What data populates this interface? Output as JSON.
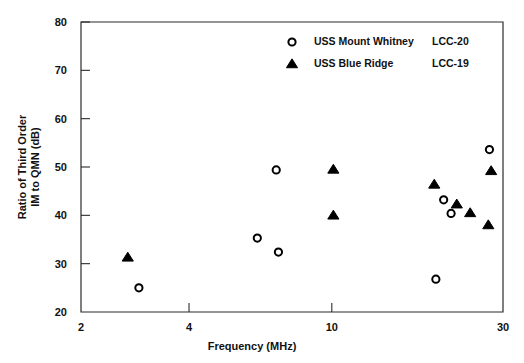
{
  "chart_data": {
    "type": "scatter",
    "title": "",
    "xlabel": "Frequency (MHz)",
    "ylabel": "Ratio of Third Order IM to QMN (dB)",
    "ylabel_line1": "Ratio of Third Order",
    "ylabel_line2": "IM to QMN (dB)",
    "xscale": "log",
    "yscale": "linear",
    "xlim": [
      2,
      30
    ],
    "ylim": [
      20,
      80
    ],
    "xticks": [
      2,
      4,
      10,
      30
    ],
    "xticklabels": [
      "2",
      "4",
      "10",
      "30"
    ],
    "yticks": [
      20,
      30,
      40,
      50,
      60,
      70,
      80
    ],
    "yticklabels": [
      "20",
      "30",
      "40",
      "50",
      "60",
      "70",
      "80"
    ],
    "grid": false,
    "legend_position": "top-right",
    "series": [
      {
        "name": "USS Mount Whitney",
        "hull": "LCC-20",
        "marker": "circle",
        "color": "#000000",
        "points": [
          {
            "x": 2.9,
            "y": 25.0
          },
          {
            "x": 6.2,
            "y": 35.3
          },
          {
            "x": 7.0,
            "y": 49.4
          },
          {
            "x": 7.1,
            "y": 32.4
          },
          {
            "x": 19.5,
            "y": 26.8
          },
          {
            "x": 20.5,
            "y": 43.2
          },
          {
            "x": 21.5,
            "y": 40.4
          },
          {
            "x": 27.5,
            "y": 53.6
          }
        ]
      },
      {
        "name": "USS Blue Ridge",
        "hull": "LCC-19",
        "marker": "triangle",
        "color": "#000000",
        "points": [
          {
            "x": 2.7,
            "y": 31.3
          },
          {
            "x": 10.1,
            "y": 49.5
          },
          {
            "x": 10.1,
            "y": 40.0
          },
          {
            "x": 19.3,
            "y": 46.4
          },
          {
            "x": 22.3,
            "y": 42.3
          },
          {
            "x": 24.3,
            "y": 40.5
          },
          {
            "x": 27.3,
            "y": 38.0
          },
          {
            "x": 27.8,
            "y": 49.2
          }
        ]
      }
    ]
  },
  "legend": {
    "entries": [
      {
        "marker": "circle",
        "name": "USS Mount Whitney",
        "hull": "LCC-20"
      },
      {
        "marker": "triangle",
        "name": "USS Blue Ridge",
        "hull": "LCC-19"
      }
    ]
  },
  "axes": {
    "x": {
      "label": "Frequency (MHz)",
      "ticks": [
        {
          "value": 2,
          "label": "2"
        },
        {
          "value": 4,
          "label": "4"
        },
        {
          "value": 10,
          "label": "10"
        },
        {
          "value": 30,
          "label": "30"
        }
      ]
    },
    "y": {
      "label_line1": "Ratio of Third Order",
      "label_line2": "IM to QMN (dB)",
      "ticks": [
        {
          "value": 20,
          "label": "20"
        },
        {
          "value": 30,
          "label": "30"
        },
        {
          "value": 40,
          "label": "40"
        },
        {
          "value": 50,
          "label": "50"
        },
        {
          "value": 60,
          "label": "60"
        },
        {
          "value": 70,
          "label": "70"
        },
        {
          "value": 80,
          "label": "80"
        }
      ]
    }
  }
}
